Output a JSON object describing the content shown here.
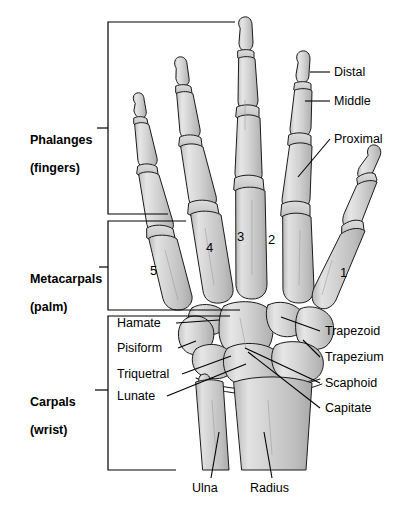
{
  "figure": {
    "background_color": "#ffffff",
    "line_color": "#000000",
    "bone_fill": "#d8d8d8",
    "bone_shade": "#b9b9b9"
  },
  "group_labels": [
    {
      "name": "phalanges",
      "line1": "Phalanges",
      "line2": "(fingers)"
    },
    {
      "name": "metacarpals",
      "line1": "Metacarpals",
      "line2": "(palm)"
    },
    {
      "name": "carpals",
      "line1": "Carpals",
      "line2": "(wrist)"
    }
  ],
  "phalanx_labels": [
    {
      "name": "distal",
      "text": "Distal"
    },
    {
      "name": "middle",
      "text": "Middle"
    },
    {
      "name": "proximal",
      "text": "Proximal"
    }
  ],
  "digit_numbers": [
    {
      "name": "digit-5",
      "text": "5"
    },
    {
      "name": "digit-4",
      "text": "4"
    },
    {
      "name": "digit-3",
      "text": "3"
    },
    {
      "name": "digit-2",
      "text": "2"
    },
    {
      "name": "digit-1",
      "text": "1"
    }
  ],
  "carpal_labels_left": [
    {
      "name": "hamate",
      "text": "Hamate"
    },
    {
      "name": "pisiform",
      "text": "Pisiform"
    },
    {
      "name": "triquetral",
      "text": "Triquetral"
    },
    {
      "name": "lunate",
      "text": "Lunate"
    }
  ],
  "carpal_labels_right": [
    {
      "name": "trapezoid",
      "text": "Trapezoid"
    },
    {
      "name": "trapezium",
      "text": "Trapezium"
    },
    {
      "name": "scaphoid",
      "text": "Scaphoid"
    },
    {
      "name": "capitate",
      "text": "Capitate"
    }
  ],
  "forearm_labels": [
    {
      "name": "ulna",
      "text": "Ulna"
    },
    {
      "name": "radius",
      "text": "Radius"
    }
  ]
}
